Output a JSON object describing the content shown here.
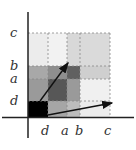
{
  "labels": {
    "y": [
      {
        "text": "c",
        "x": 10,
        "y": 26
      },
      {
        "text": "b",
        "x": 10,
        "y": 59
      },
      {
        "text": "a",
        "x": 10,
        "y": 72
      },
      {
        "text": "d",
        "x": 10,
        "y": 94
      }
    ],
    "x": [
      {
        "text": "d",
        "x": 41,
        "y": 124
      },
      {
        "text": "a",
        "x": 61,
        "y": 124
      },
      {
        "text": "b",
        "x": 75,
        "y": 124
      },
      {
        "text": "c",
        "x": 104,
        "y": 124
      }
    ]
  },
  "grid": {
    "xs": [
      28,
      48,
      67,
      80,
      110
    ],
    "ys": [
      33,
      66,
      79,
      101,
      117
    ],
    "shades": [
      [
        "#ececec",
        "#f2f2f2",
        "#d8d8d8",
        "#dadada"
      ],
      [
        "#a8a8a8",
        "#8e8e8e",
        "#606060",
        "#cfcfcf"
      ],
      [
        "#9a9a9a",
        "#575757",
        "#9a9a9a",
        "#f0f0f0"
      ],
      [
        "#000000",
        "#a6a6a6",
        "#bcbcbc",
        "#ececec"
      ]
    ]
  },
  "vectors": [
    {
      "name": "vector-up",
      "x1": 40,
      "y1": 101,
      "x2": 68,
      "y2": 63
    },
    {
      "name": "vector-right",
      "x1": 48,
      "y1": 115,
      "x2": 112,
      "y2": 103
    }
  ]
}
